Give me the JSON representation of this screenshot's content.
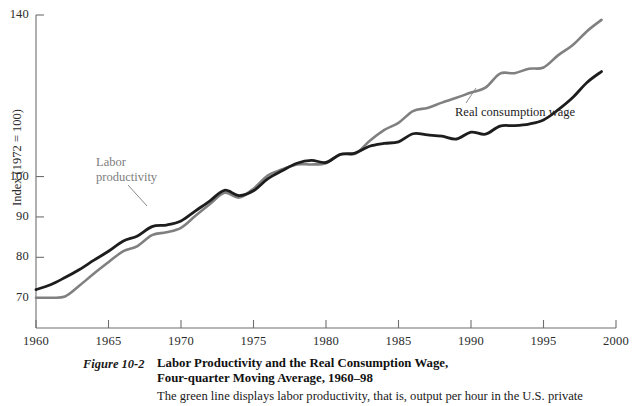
{
  "figure": {
    "number_label": "Figure 10-2",
    "title_line1": "Labor Productivity and the Real Consumption Wage,",
    "title_line2": "Four-quarter Moving Average, 1960–98",
    "body_text": "The green line displays labor productivity, that is, output per hour in the U.S. private"
  },
  "annotations": {
    "productivity_line1": "Labor",
    "productivity_line2": "productivity",
    "wage": "Real consumption wage"
  },
  "colors": {
    "labor_productivity": "#808080",
    "real_consumption_wage": "#1d1d1d",
    "axis": "#6e6e6e",
    "text": "#1a1a1a"
  },
  "chart_data": {
    "type": "line",
    "title": "Labor Productivity and the Real Consumption Wage, Four-quarter Moving Average, 1960–98",
    "xlabel": "",
    "ylabel": "Index (1972 = 100)",
    "xlim": [
      1960,
      2000
    ],
    "ylim": [
      62.5,
      140
    ],
    "grid": false,
    "legend_position": "inline-annotation",
    "xticks": [
      1960,
      1965,
      1970,
      1975,
      1980,
      1985,
      1990,
      1995,
      2000
    ],
    "xtick_labels": [
      "1960",
      "1965",
      "1970",
      "1975",
      "1980",
      "1985",
      "1990",
      "1995",
      "2000"
    ],
    "yticks": [
      70,
      80,
      90,
      100,
      140
    ],
    "ytick_labels": [
      "70",
      "80",
      "90",
      "100",
      "140"
    ],
    "x": [
      1960,
      1961,
      1962,
      1963,
      1964,
      1965,
      1966,
      1967,
      1968,
      1969,
      1970,
      1971,
      1972,
      1973,
      1974,
      1975,
      1976,
      1977,
      1978,
      1979,
      1980,
      1981,
      1982,
      1983,
      1984,
      1985,
      1986,
      1987,
      1988,
      1989,
      1990,
      1991,
      1992,
      1993,
      1994,
      1995,
      1996,
      1997,
      1998,
      1999
    ],
    "series": [
      {
        "name": "Labor productivity",
        "color": "#808080",
        "values": [
          70.0,
          70.0,
          70.3,
          73.0,
          76.0,
          78.8,
          81.5,
          82.8,
          85.5,
          86.2,
          87.3,
          90.3,
          93.2,
          96.0,
          94.8,
          97.0,
          100.3,
          101.8,
          103.0,
          103.0,
          103.3,
          105.5,
          105.6,
          108.8,
          111.5,
          113.3,
          116.2,
          117.0,
          118.3,
          119.5,
          120.8,
          122.0,
          125.5,
          125.6,
          126.7,
          127.0,
          130.0,
          132.5,
          136.0,
          138.8
        ]
      },
      {
        "name": "Real consumption wage",
        "color": "#1d1d1d",
        "values": [
          72.0,
          73.2,
          75.0,
          77.0,
          79.3,
          81.5,
          84.0,
          85.3,
          87.6,
          88.0,
          89.0,
          91.5,
          94.0,
          96.6,
          95.3,
          96.5,
          99.5,
          101.5,
          103.3,
          104.0,
          103.5,
          105.5,
          105.8,
          107.5,
          108.2,
          108.6,
          110.6,
          110.3,
          110.0,
          109.3,
          111.0,
          110.5,
          112.5,
          112.6,
          113.0,
          114.0,
          116.5,
          119.5,
          123.3,
          126.0
        ]
      }
    ]
  }
}
